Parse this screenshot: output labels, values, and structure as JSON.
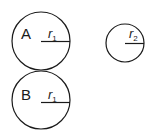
{
  "diagram": {
    "stroke_color": "#1a1a1a",
    "background": "#ffffff",
    "circles": [
      {
        "id": "A",
        "label": "A",
        "radius_label": "r",
        "radius_sub": "1",
        "cx": 41,
        "cy": 41,
        "r": 29
      },
      {
        "id": "B",
        "label": "B",
        "radius_label": "r",
        "radius_sub": "1",
        "cx": 41,
        "cy": 100,
        "r": 29
      },
      {
        "id": "C",
        "label": "",
        "radius_label": "r",
        "radius_sub": "2",
        "cx": 125,
        "cy": 43,
        "r": 19
      }
    ]
  }
}
